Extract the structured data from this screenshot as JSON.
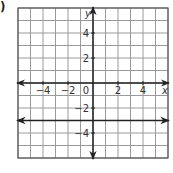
{
  "problem_marker": ")",
  "graph": {
    "x_axis_label": "x",
    "y_axis_label": "y",
    "x_ticks": [
      {
        "value": -4,
        "label": "−4"
      },
      {
        "value": -2,
        "label": "−2"
      },
      {
        "value": 2,
        "label": "2"
      },
      {
        "value": 4,
        "label": "4"
      }
    ],
    "y_ticks": [
      {
        "value": 4,
        "label": "4"
      },
      {
        "value": 2,
        "label": "2"
      },
      {
        "value": -2,
        "label": "−2"
      },
      {
        "value": -4,
        "label": "−4"
      }
    ],
    "origin_label": "0",
    "grid": {
      "xmin": -6,
      "xmax": 6,
      "ymin": -6,
      "ymax": 6,
      "step": 1
    },
    "line": {
      "equation": "y = -3",
      "y": -3,
      "color": "#222222"
    }
  },
  "chart_data": {
    "type": "line",
    "title": "",
    "xlabel": "x",
    "ylabel": "y",
    "xlim": [
      -6,
      6
    ],
    "ylim": [
      -6,
      6
    ],
    "grid": true,
    "x_tick_labels": [
      "-4",
      "-2",
      "0",
      "2",
      "4"
    ],
    "y_tick_labels": [
      "4",
      "2",
      "-2",
      "-4"
    ],
    "series": [
      {
        "name": "y = -3",
        "x": [
          -6,
          6
        ],
        "y": [
          -3,
          -3
        ],
        "arrows_both_ends": true
      }
    ]
  }
}
